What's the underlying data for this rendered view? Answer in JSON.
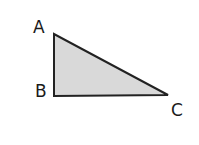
{
  "diagram": {
    "type": "right-triangle",
    "fill_color": "#d9d9d9",
    "stroke_color": "#222222",
    "vertices": [
      {
        "label": "A",
        "x": 54,
        "y": 34
      },
      {
        "label": "B",
        "x": 54,
        "y": 96
      },
      {
        "label": "C",
        "x": 168,
        "y": 95
      }
    ],
    "right_angle_at": "B"
  }
}
